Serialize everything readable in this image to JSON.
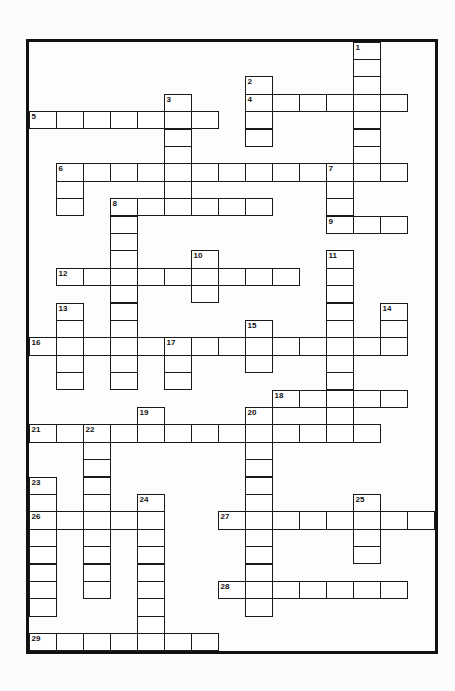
{
  "puzzle": {
    "cols": 15,
    "rows": 35,
    "cell_w": 27,
    "cell_h": 17.4,
    "line_color": "#1a1a1a",
    "words": [
      {
        "num": 1,
        "dir": "down",
        "row": 0,
        "col": 12,
        "len": 8
      },
      {
        "num": 2,
        "dir": "down",
        "row": 2,
        "col": 8,
        "len": 4
      },
      {
        "num": 3,
        "dir": "down",
        "row": 3,
        "col": 5,
        "len": 7
      },
      {
        "num": 4,
        "dir": "across",
        "row": 3,
        "col": 8,
        "len": 6
      },
      {
        "num": 5,
        "dir": "across",
        "row": 4,
        "col": 0,
        "len": 7
      },
      {
        "num": 6,
        "dir": "across",
        "row": 7,
        "col": 1,
        "len": 13
      },
      {
        "num": 6,
        "dir": "down",
        "row": 7,
        "col": 1,
        "len": 3
      },
      {
        "num": 7,
        "dir": "down",
        "row": 7,
        "col": 11,
        "len": 4
      },
      {
        "num": 8,
        "dir": "across",
        "row": 9,
        "col": 3,
        "len": 6
      },
      {
        "num": 8,
        "dir": "down",
        "row": 9,
        "col": 3,
        "len": 11
      },
      {
        "num": 9,
        "dir": "across",
        "row": 10,
        "col": 11,
        "len": 3
      },
      {
        "num": 10,
        "dir": "down",
        "row": 12,
        "col": 6,
        "len": 3
      },
      {
        "num": 11,
        "dir": "down",
        "row": 12,
        "col": 11,
        "len": 11
      },
      {
        "num": 12,
        "dir": "across",
        "row": 13,
        "col": 1,
        "len": 9
      },
      {
        "num": 13,
        "dir": "down",
        "row": 15,
        "col": 1,
        "len": 5
      },
      {
        "num": 14,
        "dir": "down",
        "row": 15,
        "col": 13,
        "len": 3
      },
      {
        "num": 15,
        "dir": "down",
        "row": 16,
        "col": 8,
        "len": 3
      },
      {
        "num": 16,
        "dir": "across",
        "row": 17,
        "col": 0,
        "len": 14
      },
      {
        "num": 17,
        "dir": "down",
        "row": 17,
        "col": 5,
        "len": 3
      },
      {
        "num": 18,
        "dir": "across",
        "row": 20,
        "col": 9,
        "len": 5
      },
      {
        "num": 19,
        "dir": "down",
        "row": 21,
        "col": 4,
        "len": 2
      },
      {
        "num": 20,
        "dir": "down",
        "row": 21,
        "col": 8,
        "len": 12
      },
      {
        "num": 21,
        "dir": "across",
        "row": 22,
        "col": 0,
        "len": 13
      },
      {
        "num": 22,
        "dir": "down",
        "row": 22,
        "col": 2,
        "len": 10
      },
      {
        "num": 23,
        "dir": "down",
        "row": 25,
        "col": 0,
        "len": 8
      },
      {
        "num": 24,
        "dir": "down",
        "row": 26,
        "col": 4,
        "len": 9
      },
      {
        "num": 25,
        "dir": "down",
        "row": 26,
        "col": 12,
        "len": 4
      },
      {
        "num": 26,
        "dir": "across",
        "row": 27,
        "col": 0,
        "len": 5
      },
      {
        "num": 27,
        "dir": "across",
        "row": 27,
        "col": 7,
        "len": 8
      },
      {
        "num": 28,
        "dir": "across",
        "row": 31,
        "col": 7,
        "len": 7
      },
      {
        "num": 29,
        "dir": "across",
        "row": 34,
        "col": 0,
        "len": 7
      }
    ]
  }
}
